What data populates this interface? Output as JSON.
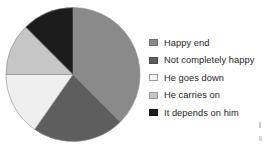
{
  "chart_data": {
    "type": "pie",
    "title": "",
    "subtitle": "",
    "xlabel": "",
    "ylabel": "",
    "grid": false,
    "legend_position": "right",
    "start_angle_deg": 0,
    "direction": "clockwise",
    "center": {
      "x": 73,
      "y": 74.5
    },
    "radius": 67,
    "categories": [
      "Happy end",
      "Not completely happy",
      "He goes down",
      "He carries on",
      "It depends on him"
    ],
    "values": [
      37.5,
      22.2,
      15.3,
      12.5,
      12.5
    ],
    "slices": [
      {
        "label": "Happy end",
        "value": 37.5,
        "color": "#8a8a8a",
        "start_angle_deg": 0,
        "end_angle_deg": 135
      },
      {
        "label": "Not completely happy",
        "value": 22.2,
        "color": "#5e5e5e",
        "start_angle_deg": 135,
        "end_angle_deg": 215
      },
      {
        "label": "He goes down",
        "value": 15.3,
        "color": "#efefef",
        "start_angle_deg": 215,
        "end_angle_deg": 270
      },
      {
        "label": "He carries on",
        "value": 12.5,
        "color": "#c6c6c6",
        "start_angle_deg": 270,
        "end_angle_deg": 315
      },
      {
        "label": "It depends on him",
        "value": 12.5,
        "color": "#1c1c1c",
        "start_angle_deg": 315,
        "end_angle_deg": 360
      }
    ]
  },
  "legend": {
    "items": [
      {
        "label": "Happy end",
        "color": "#8a8a8a",
        "border": "#6f6f6f"
      },
      {
        "label": "Not completely happy",
        "color": "#5e5e5e",
        "border": "#4a4a4a"
      },
      {
        "label": "He goes down",
        "color": "#f4f4f4",
        "border": "#9a9a9a"
      },
      {
        "label": "He carries on",
        "color": "#c6c6c6",
        "border": "#9a9a9a"
      },
      {
        "label": "It depends on him",
        "color": "#1c1c1c",
        "border": "#101010"
      }
    ]
  }
}
